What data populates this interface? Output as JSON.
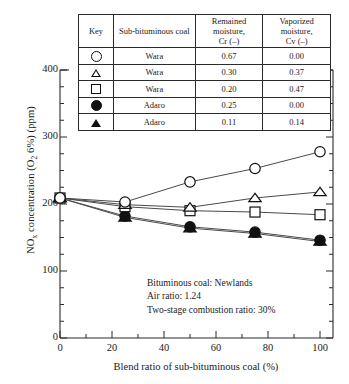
{
  "chart_data": {
    "type": "line",
    "title": "",
    "xlabel": "Blend ratio of sub-bituminous coal (%)",
    "ylabel": "NOx concentration (O2 6%) (ppm)",
    "xlim": [
      0,
      105
    ],
    "ylim": [
      0,
      400
    ],
    "xticks": [
      0,
      20,
      40,
      60,
      80,
      100
    ],
    "yticks": [
      0,
      100,
      200,
      300,
      400
    ],
    "x_minor_interval": 10,
    "y_minor_interval": 25,
    "grid": false,
    "legend_position": "top-table",
    "x": [
      0,
      25,
      50,
      75,
      100
    ],
    "series": [
      {
        "name": "Wara, Cr 0.67, Cv 0.00",
        "marker": "circle-open",
        "values": [
          209,
          203,
          233,
          253,
          278
        ]
      },
      {
        "name": "Wara, Cr 0.30, Cv 0.37",
        "marker": "triangle-open",
        "values": [
          209,
          199,
          195,
          209,
          218
        ]
      },
      {
        "name": "Wara, Cr 0.20, Cv 0.47",
        "marker": "square-open",
        "values": [
          209,
          196,
          190,
          188,
          184
        ]
      },
      {
        "name": "Adaro, Cr 0.25, Cv 0.00",
        "marker": "circle-filled",
        "values": [
          209,
          182,
          166,
          158,
          146
        ]
      },
      {
        "name": "Adaro, Cr 0.11, Cv 0.14",
        "marker": "triangle-filled",
        "values": [
          209,
          180,
          164,
          156,
          144
        ]
      }
    ],
    "annotations": [
      "Bituminous coal: Newlands",
      "Air ratio: 1.24",
      "Two-stage combustion ratio: 30%"
    ]
  },
  "key_table": {
    "headers": {
      "key": "Key",
      "coal": "Sub-bituminous coal",
      "cr_line1": "Remained",
      "cr_line2": "moisture,",
      "cr_line3": "Cr (–)",
      "cv_line1": "Vaporized",
      "cv_line2": "moisture,",
      "cv_line3": "Cv (–)"
    },
    "rows": [
      {
        "marker": "circle-open",
        "coal": "Wara",
        "cr": "0.67",
        "cv": "0.00"
      },
      {
        "marker": "triangle-open",
        "coal": "Wara",
        "cr": "0.30",
        "cv": "0.37"
      },
      {
        "marker": "square-open",
        "coal": "Wara",
        "cr": "0.20",
        "cv": "0.47"
      },
      {
        "marker": "circle-filled",
        "coal": "Adaro",
        "cr": "0.25",
        "cv": "0.00"
      },
      {
        "marker": "triangle-filled",
        "coal": "Adaro",
        "cr": "0.11",
        "cv": "0.14"
      }
    ]
  },
  "axes": {
    "y_tick_labels": [
      "400",
      "300",
      "200",
      "100",
      "0"
    ],
    "x_tick_labels": [
      "0",
      "20",
      "40",
      "60",
      "80",
      "100"
    ],
    "y_axis_title": "NOx concentration (O2 6%) (ppm)",
    "x_axis_title": "Blend ratio of sub-bituminous coal (%)"
  },
  "annotation_block": {
    "line1": "Bituminous coal: Newlands",
    "line2": "Air ratio: 1.24",
    "line3": "Two-stage combustion ratio: 30%"
  },
  "colors": {
    "axis": "#2b2b2b",
    "marker_stroke": "#111111",
    "marker_fill_open": "#ffffff",
    "marker_fill_solid": "#111111",
    "line": "#4a4a4a",
    "background": "#ffffff"
  }
}
